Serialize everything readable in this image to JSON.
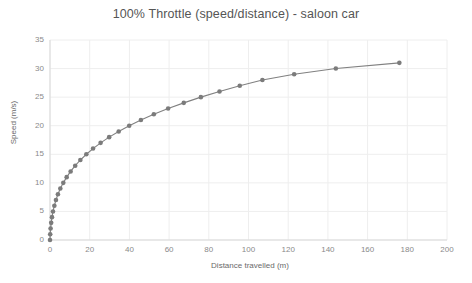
{
  "chart_data": {
    "type": "line",
    "title": "100% Throttle (speed/distance) - saloon car",
    "xlabel": "Distance travelled (m)",
    "ylabel": "Speed (m/s)",
    "xlim": [
      0,
      200
    ],
    "ylim": [
      0,
      35
    ],
    "xticks": [
      0,
      20,
      40,
      60,
      80,
      100,
      120,
      140,
      160,
      180,
      200
    ],
    "yticks": [
      0,
      5,
      10,
      15,
      20,
      25,
      30,
      35
    ],
    "grid": true,
    "legend": "none",
    "marker": "circle",
    "series": [
      {
        "name": "Speed vs distance",
        "color": "#808080",
        "x": [
          0.0,
          0.1,
          0.3,
          0.6,
          1.0,
          1.5,
          2.2,
          3.0,
          4.0,
          5.2,
          6.7,
          8.4,
          10.4,
          12.7,
          15.3,
          18.3,
          21.7,
          25.5,
          29.8,
          34.6,
          39.9,
          45.8,
          52.3,
          59.5,
          67.4,
          76.0,
          85.4,
          95.6,
          107.0,
          123.0,
          144.0,
          176.0
        ],
        "y": [
          0,
          1,
          2,
          3,
          4,
          5,
          6,
          7,
          8,
          9,
          10,
          11,
          12,
          13,
          14,
          15,
          16,
          17,
          18,
          19,
          20,
          21,
          22,
          23,
          24,
          25,
          26,
          27,
          28,
          29,
          30,
          31
        ]
      }
    ]
  },
  "axes": {
    "y_title": "Speed (m/s)",
    "x_title": "Distance travelled (m)"
  },
  "colors": {
    "line": "#808080",
    "marker": "#7b7b7b",
    "grid": "#eeeeee",
    "axis": "#d9d9d9",
    "title_text": "#555555",
    "tick_text": "#8a8a8a"
  }
}
